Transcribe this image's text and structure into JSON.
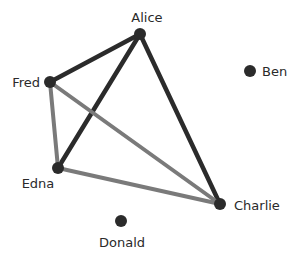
{
  "diagram": {
    "type": "network-graph",
    "nodes": [
      {
        "id": "alice",
        "label": "Alice",
        "x": 140,
        "y": 34,
        "label_x": 147,
        "label_y": 22,
        "anchor": "middle"
      },
      {
        "id": "fred",
        "label": "Fred",
        "x": 50,
        "y": 82,
        "label_x": 40,
        "label_y": 87,
        "anchor": "end"
      },
      {
        "id": "ben",
        "label": "Ben",
        "x": 250,
        "y": 71,
        "label_x": 262,
        "label_y": 76,
        "anchor": "start"
      },
      {
        "id": "edna",
        "label": "Edna",
        "x": 58,
        "y": 168,
        "label_x": 38,
        "label_y": 188,
        "anchor": "middle"
      },
      {
        "id": "charlie",
        "label": "Charlie",
        "x": 220,
        "y": 204,
        "label_x": 234,
        "label_y": 210,
        "anchor": "start"
      },
      {
        "id": "donald",
        "label": "Donald",
        "x": 121,
        "y": 221,
        "label_x": 122,
        "label_y": 247,
        "anchor": "middle"
      }
    ],
    "edges": [
      {
        "from": "alice",
        "to": "fred",
        "style": "strong",
        "color": "#2b2b2b"
      },
      {
        "from": "alice",
        "to": "edna",
        "style": "strong",
        "color": "#2b2b2b"
      },
      {
        "from": "alice",
        "to": "charlie",
        "style": "strong",
        "color": "#2b2b2b"
      },
      {
        "from": "fred",
        "to": "edna",
        "style": "weak",
        "color": "#7a7a7a"
      },
      {
        "from": "fred",
        "to": "charlie",
        "style": "weak",
        "color": "#7a7a7a"
      },
      {
        "from": "edna",
        "to": "charlie",
        "style": "weak",
        "color": "#7a7a7a"
      }
    ],
    "node_color": "#2b2b2b",
    "node_radius": 6
  }
}
